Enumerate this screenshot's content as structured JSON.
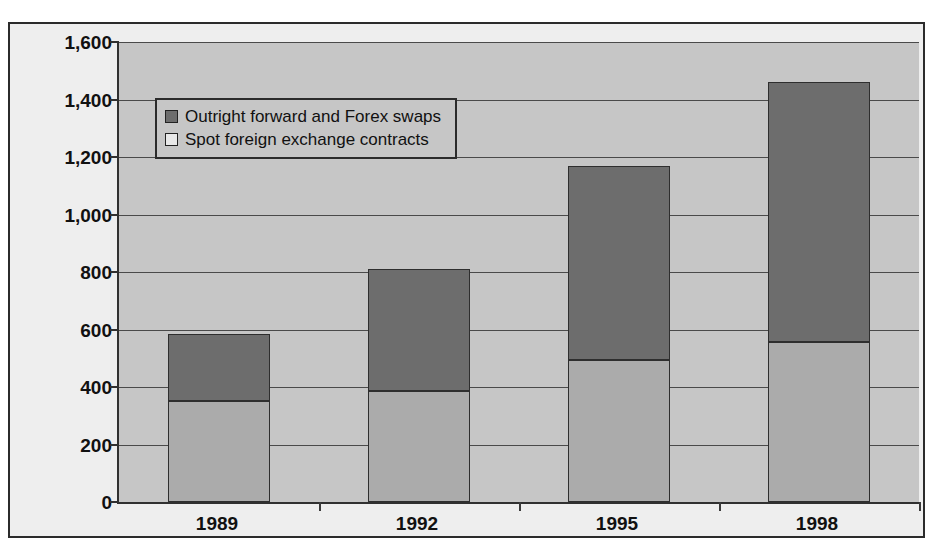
{
  "chart_data": {
    "type": "bar",
    "stacked": true,
    "title": "",
    "xlabel": "",
    "ylabel": "",
    "categories": [
      "1989",
      "1992",
      "1995",
      "1998"
    ],
    "series": [
      {
        "name": "Spot foreign exchange contracts",
        "color": "#ababab",
        "values": [
          350,
          385,
          495,
          555
        ]
      },
      {
        "name": "Outright forward and Forex swaps",
        "color": "#6d6d6d",
        "values": [
          235,
          425,
          675,
          905
        ]
      }
    ],
    "totals": [
      585,
      810,
      1170,
      1460
    ],
    "ylim": [
      0,
      1600
    ],
    "ytick_values": [
      0,
      200,
      400,
      600,
      800,
      1000,
      1200,
      1400,
      1600
    ],
    "ytick_labels": [
      "0",
      "200",
      "400",
      "600",
      "800",
      "1,000",
      "1,200",
      "1,400",
      "1,600"
    ],
    "grid": true,
    "legend_position": "top-left-inside",
    "legend_entries": [
      {
        "label": "Outright forward and Forex swaps",
        "swatch": "dark"
      },
      {
        "label": "Spot foreign exchange contracts",
        "swatch": "light"
      }
    ],
    "colors": {
      "plot_background": "#c6c6c6",
      "frame_background": "#eeeeee",
      "axis": "#303030",
      "gridline": "#4a4a4a",
      "series_bottom": "#ababab",
      "series_top": "#6d6d6d"
    }
  }
}
